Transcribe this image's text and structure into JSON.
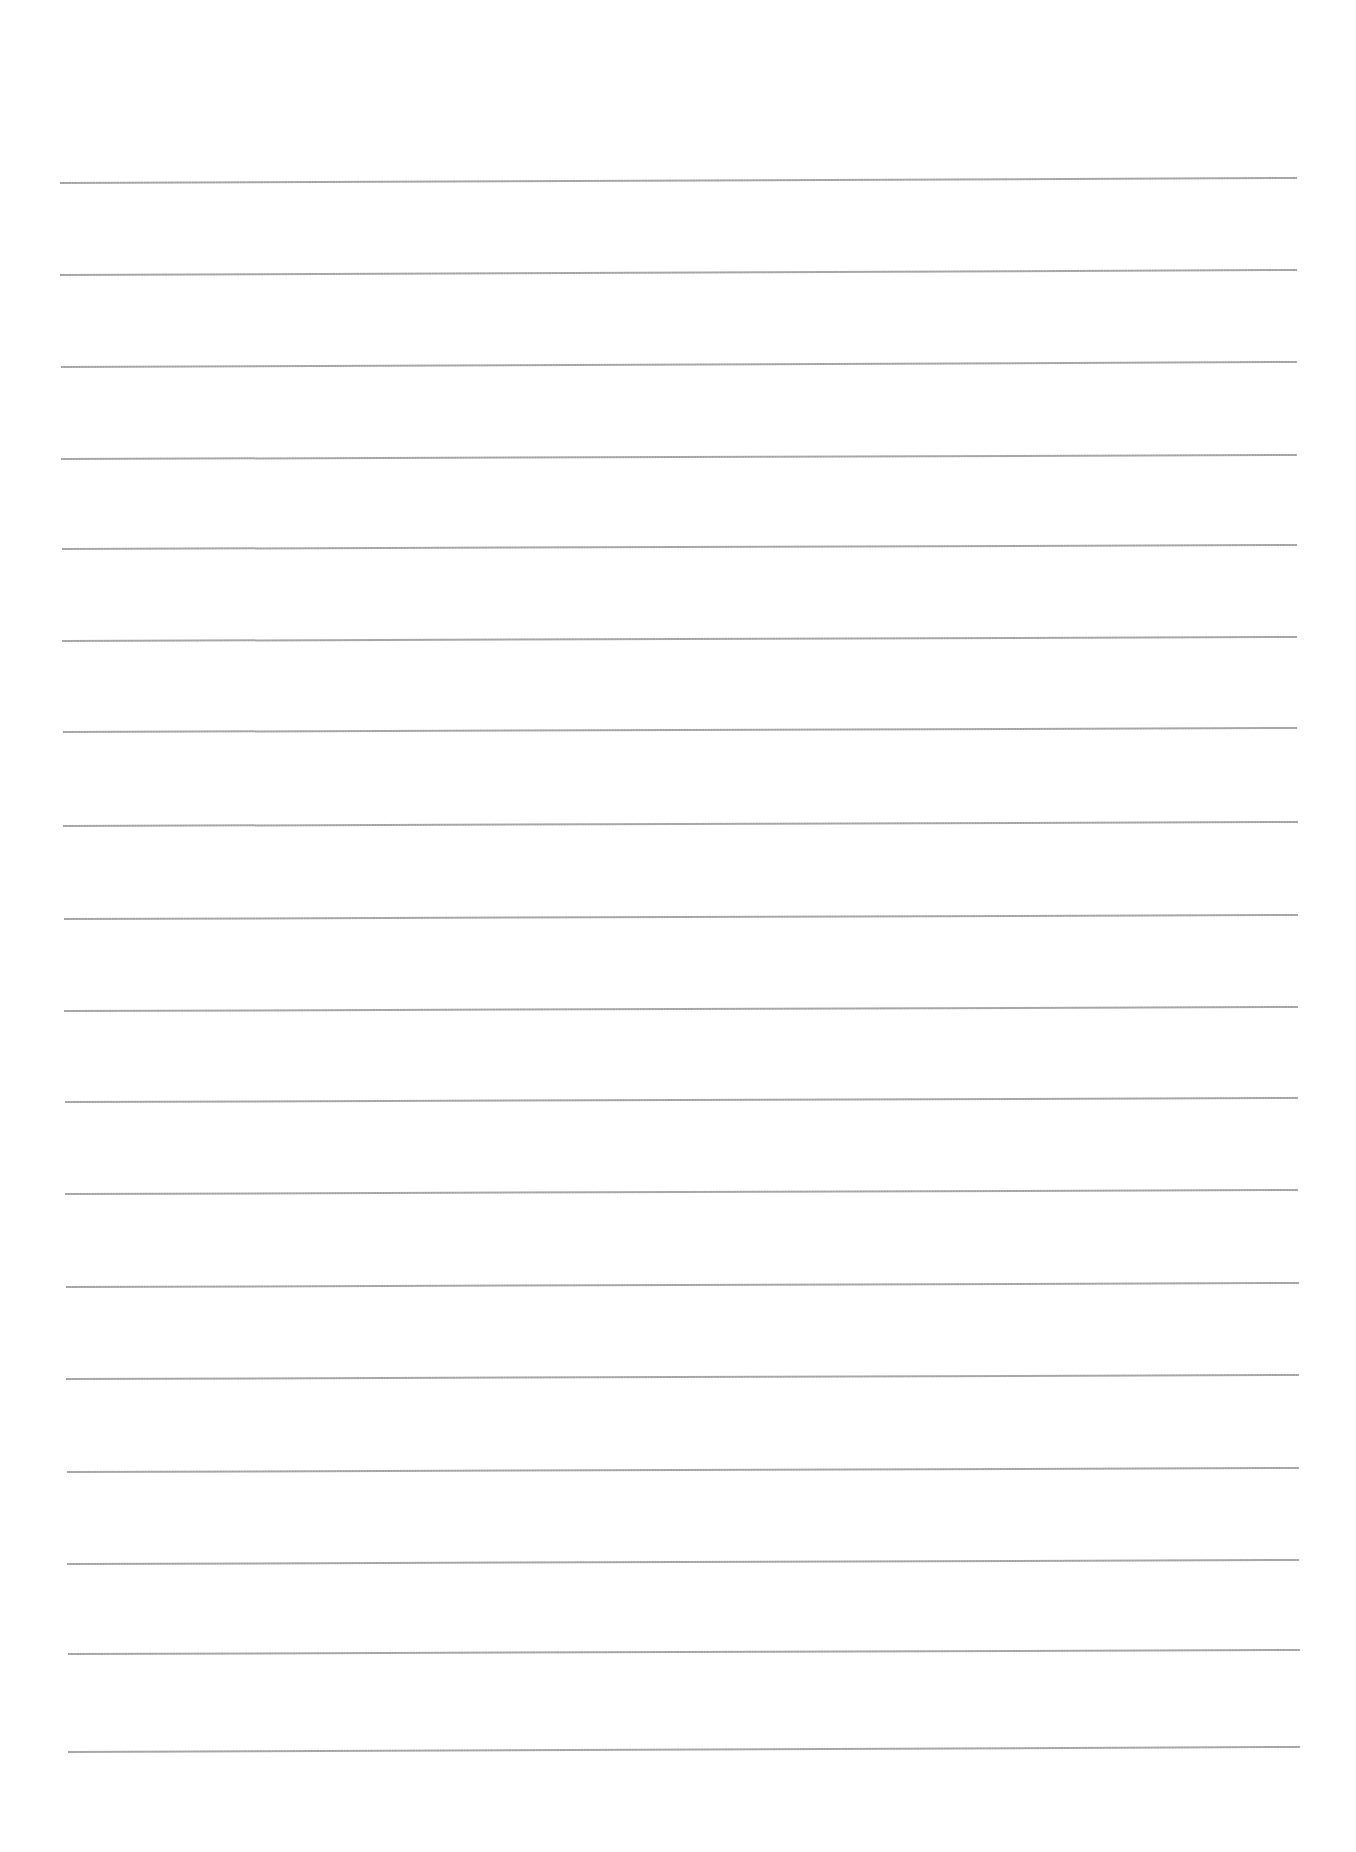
{
  "document": {
    "type": "blank lined paper",
    "line_color": "#999999",
    "background_color": "#ffffff",
    "line_count": 18,
    "lines": [
      {
        "y_left": 183,
        "y_right": 178,
        "x_start": 60,
        "x_end": 1297
      },
      {
        "y_left": 275,
        "y_right": 270,
        "x_start": 60,
        "x_end": 1297
      },
      {
        "y_left": 367,
        "y_right": 362,
        "x_start": 61,
        "x_end": 1297
      },
      {
        "y_left": 459,
        "y_right": 455,
        "x_start": 61,
        "x_end": 1297
      },
      {
        "y_left": 549,
        "y_right": 545,
        "x_start": 62,
        "x_end": 1297
      },
      {
        "y_left": 641,
        "y_right": 637,
        "x_start": 62,
        "x_end": 1297
      },
      {
        "y_left": 732,
        "y_right": 728,
        "x_start": 63,
        "x_end": 1297
      },
      {
        "y_left": 826,
        "y_right": 822,
        "x_start": 63,
        "x_end": 1298
      },
      {
        "y_left": 919,
        "y_right": 915,
        "x_start": 64,
        "x_end": 1298
      },
      {
        "y_left": 1011,
        "y_right": 1007,
        "x_start": 64,
        "x_end": 1298
      },
      {
        "y_left": 1102,
        "y_right": 1098,
        "x_start": 65,
        "x_end": 1298
      },
      {
        "y_left": 1194,
        "y_right": 1190,
        "x_start": 65,
        "x_end": 1298
      },
      {
        "y_left": 1287,
        "y_right": 1283,
        "x_start": 66,
        "x_end": 1299
      },
      {
        "y_left": 1379,
        "y_right": 1375,
        "x_start": 66,
        "x_end": 1299
      },
      {
        "y_left": 1472,
        "y_right": 1468,
        "x_start": 67,
        "x_end": 1299
      },
      {
        "y_left": 1564,
        "y_right": 1560,
        "x_start": 67,
        "x_end": 1299
      },
      {
        "y_left": 1654,
        "y_right": 1650,
        "x_start": 68,
        "x_end": 1300
      },
      {
        "y_left": 1752,
        "y_right": 1747,
        "x_start": 68,
        "x_end": 1300
      }
    ]
  }
}
